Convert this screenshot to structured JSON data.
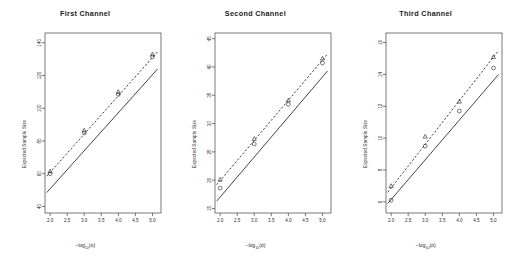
{
  "figure": {
    "width": 511,
    "height": 264,
    "background": "#ffffff",
    "panel_count": 3
  },
  "common": {
    "xlabel_prefix": "−log",
    "xlabel_sub": "10",
    "xlabel_suffix": "(α)",
    "ylabel": "Expected Sample Size",
    "xticks": [
      "2.0",
      "2.5",
      "3.0",
      "3.5",
      "4.0",
      "4.5",
      "5.0"
    ],
    "xlim": [
      1.85,
      5.25
    ],
    "line_color": "#222222",
    "point_color": "#222222"
  },
  "chart_data": [
    {
      "type": "line",
      "title": "First Channel",
      "xlabel": "−log10(α)",
      "ylabel": "Expected Sample Size",
      "xlim": [
        1.85,
        5.25
      ],
      "ylim": [
        36,
        146
      ],
      "xticks": [
        2.0,
        2.5,
        3.0,
        3.5,
        4.0,
        4.5,
        5.0
      ],
      "yticks": [
        40,
        60,
        80,
        100,
        120,
        140
      ],
      "ytick_labels": [
        "40",
        "60",
        "80",
        "100",
        "120",
        "140"
      ],
      "grid": false,
      "legend": "none",
      "series": [
        {
          "name": "solid-line",
          "style": "solid",
          "x": [
            1.9,
            5.15
          ],
          "y": [
            48.5,
            124.0
          ]
        },
        {
          "name": "dashed-line",
          "style": "dashed",
          "x": [
            1.9,
            5.15
          ],
          "y": [
            58.5,
            134.5
          ]
        }
      ],
      "points": [
        {
          "marker": "triangle",
          "x": 2.0,
          "y": 61.5
        },
        {
          "marker": "circle",
          "x": 2.0,
          "y": 60.0
        },
        {
          "marker": "triangle",
          "x": 3.0,
          "y": 86.5
        },
        {
          "marker": "circle",
          "x": 3.0,
          "y": 85.0
        },
        {
          "marker": "triangle",
          "x": 4.0,
          "y": 110.0
        },
        {
          "marker": "circle",
          "x": 4.0,
          "y": 108.5
        },
        {
          "marker": "triangle",
          "x": 5.0,
          "y": 133.0
        },
        {
          "marker": "circle",
          "x": 5.0,
          "y": 131.5
        }
      ]
    },
    {
      "type": "line",
      "title": "Second  Channel",
      "xlabel": "−log10(α)",
      "ylabel": "Expected Sample Size",
      "xlim": [
        1.85,
        5.25
      ],
      "ylim": [
        14.2,
        46.0
      ],
      "xticks": [
        2.0,
        2.5,
        3.0,
        3.5,
        4.0,
        4.5,
        5.0
      ],
      "yticks": [
        15,
        20,
        25,
        30,
        35,
        40,
        45
      ],
      "ytick_labels": [
        "15",
        "20",
        "25",
        "30",
        "35",
        "40",
        "45"
      ],
      "grid": false,
      "legend": "none",
      "series": [
        {
          "name": "solid-line",
          "style": "solid",
          "x": [
            1.9,
            5.15
          ],
          "y": [
            16.3,
            39.3
          ]
        },
        {
          "name": "dashed-line",
          "style": "dashed",
          "x": [
            1.9,
            5.15
          ],
          "y": [
            19.2,
            42.3
          ]
        }
      ],
      "points": [
        {
          "marker": "triangle",
          "x": 2.0,
          "y": 20.1
        },
        {
          "marker": "circle",
          "x": 2.0,
          "y": 18.6
        },
        {
          "marker": "triangle",
          "x": 3.0,
          "y": 27.3
        },
        {
          "marker": "circle",
          "x": 3.0,
          "y": 26.4
        },
        {
          "marker": "triangle",
          "x": 4.0,
          "y": 34.1
        },
        {
          "marker": "circle",
          "x": 4.0,
          "y": 33.4
        },
        {
          "marker": "triangle",
          "x": 5.0,
          "y": 41.5
        },
        {
          "marker": "circle",
          "x": 5.0,
          "y": 40.7
        }
      ]
    },
    {
      "type": "line",
      "title": "Third  Channel",
      "xlabel": "−log10(α)",
      "ylabel": "Expected Sample Size",
      "xlim": [
        1.85,
        5.25
      ],
      "ylim": [
        5.3,
        16.6
      ],
      "xticks": [
        2.0,
        2.5,
        3.0,
        3.5,
        4.0,
        4.5,
        5.0
      ],
      "yticks": [
        6,
        8,
        10,
        12,
        14,
        16
      ],
      "ytick_labels": [
        "6",
        "8",
        "10",
        "12",
        "14",
        "16"
      ],
      "grid": false,
      "legend": "none",
      "series": [
        {
          "name": "solid-line",
          "style": "solid",
          "x": [
            1.9,
            5.15
          ],
          "y": [
            5.9,
            14.0
          ]
        },
        {
          "name": "dashed-line",
          "style": "dashed",
          "x": [
            1.9,
            5.15
          ],
          "y": [
            6.6,
            15.5
          ]
        }
      ],
      "points": [
        {
          "marker": "triangle",
          "x": 2.0,
          "y": 7.0
        },
        {
          "marker": "circle",
          "x": 2.0,
          "y": 6.1
        },
        {
          "marker": "triangle",
          "x": 3.0,
          "y": 10.1
        },
        {
          "marker": "circle",
          "x": 3.0,
          "y": 9.5
        },
        {
          "marker": "triangle",
          "x": 4.0,
          "y": 12.3
        },
        {
          "marker": "circle",
          "x": 4.0,
          "y": 11.7
        },
        {
          "marker": "triangle",
          "x": 5.0,
          "y": 15.1
        },
        {
          "marker": "circle",
          "x": 5.0,
          "y": 14.4
        }
      ]
    }
  ]
}
